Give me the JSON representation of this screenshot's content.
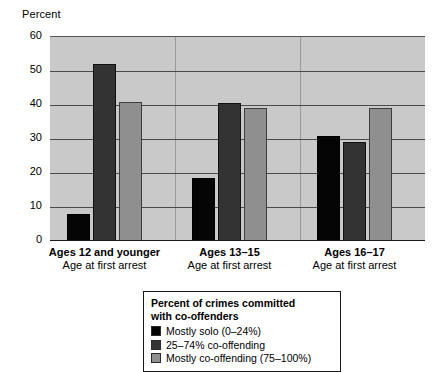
{
  "chart_data": {
    "type": "bar",
    "title": "",
    "xlabel": "Age at first arrest",
    "ylabel": "Percent",
    "ylim": [
      0,
      60
    ],
    "yticks": [
      0,
      10,
      20,
      30,
      40,
      50,
      60
    ],
    "grid": true,
    "legend_position": "below-plot",
    "legend_title_lines": [
      "Percent of crimes committed",
      "with co-offenders"
    ],
    "categories": [
      "Ages 12 and younger",
      "Ages 13–15",
      "Ages 16–17"
    ],
    "category_sublabels": [
      "Age at first arrest",
      "Age at first arrest",
      "Age at first arrest"
    ],
    "series": [
      {
        "name": "Mostly solo (0–24%)",
        "color": "#050505",
        "values": [
          8,
          18.5,
          31
        ]
      },
      {
        "name": "25–74% co-offending",
        "color": "#333333",
        "values": [
          52,
          40.5,
          29
        ]
      },
      {
        "name": "Mostly co-offending (75–100%)",
        "color": "#8f8f8f",
        "values": [
          41,
          39,
          39
        ]
      }
    ]
  },
  "colors": {
    "plot_background": "#c9c9c9",
    "gridline": "#4a4a4a",
    "axis": "#1a1a1a",
    "page_background": "#ffffff"
  }
}
